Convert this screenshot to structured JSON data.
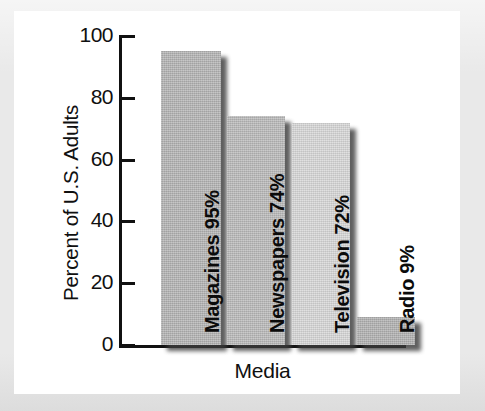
{
  "chart_data": {
    "type": "bar",
    "title": "",
    "xlabel": "Media",
    "ylabel": "Percent of U.S. Adults",
    "categories": [
      "Magazines",
      "Newspapers",
      "Television",
      "Radio"
    ],
    "values": [
      95,
      74,
      72,
      9
    ],
    "value_suffix": "%",
    "bar_labels": [
      "Magazines 95%",
      "Newspapers 74%",
      "Television 72%",
      "Radio 9%"
    ],
    "ylim": [
      0,
      100
    ],
    "y_ticks": [
      100,
      80,
      60,
      40,
      20,
      0
    ],
    "y_tick_labels": [
      "100",
      "80",
      "60",
      "40",
      "20",
      "0"
    ],
    "grid": false,
    "legend": null,
    "bar_colors": [
      "#b3b3b3",
      "#b9b9b9",
      "#d6d6d6",
      "#b0b0b0"
    ],
    "axis_color": "#111111",
    "background": "#ffffff",
    "frame_color": "#e9e9e9",
    "label_orientation": "vertical-bottom-to-top"
  }
}
